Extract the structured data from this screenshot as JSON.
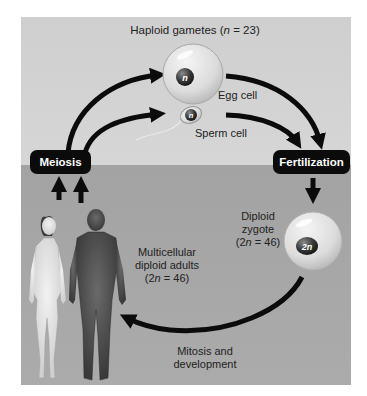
{
  "diagram": {
    "colors": {
      "upper_background": "#d2d2d2",
      "lower_background": "#a7a7a7",
      "arrow": "#0b0b0b",
      "pill_background": "#0b0b0b",
      "pill_text": "#ffffff",
      "label_text": "#222222"
    },
    "labels": {
      "gametes_heading_prefix": "Haploid gametes (",
      "gametes_heading_var": "n",
      "gametes_heading_suffix": " = 23)",
      "egg_cell": "Egg cell",
      "sperm_cell": "Sperm cell",
      "zygote_line1": "Diploid",
      "zygote_line2": "zygote",
      "zygote_line3_prefix": "(2",
      "zygote_line3_var": "n",
      "zygote_line3_suffix": " = 46)",
      "adults_line1": "Multicellular",
      "adults_line2": "diploid adults",
      "adults_line3_prefix": "(2",
      "adults_line3_var": "n",
      "adults_line3_suffix": " = 46)",
      "mitosis_line1": "Mitosis and",
      "mitosis_line2": "development"
    },
    "process_boxes": {
      "meiosis": "Meiosis",
      "fertilization": "Fertilization"
    },
    "cells": {
      "egg_nucleus": "n",
      "sperm_nucleus": "n",
      "zygote_nucleus": "2n"
    },
    "figures": [
      "female adult",
      "male adult"
    ]
  }
}
